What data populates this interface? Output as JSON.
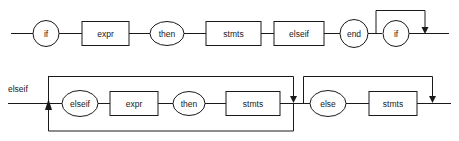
{
  "diagram": {
    "kind": "railroad-syntax-diagram",
    "background_color": "#ffffff",
    "stroke_color": "#1a1a1a",
    "fill_color": "#ffffff",
    "rows": [
      {
        "id": "row-top",
        "entry_label": "",
        "nodes": [
          {
            "id": "top-if",
            "text": "if",
            "shape": "circle"
          },
          {
            "id": "top-expr",
            "text": "expr",
            "shape": "rect"
          },
          {
            "id": "top-then",
            "text": "then",
            "shape": "ellipse"
          },
          {
            "id": "top-stmts",
            "text": "stmts",
            "shape": "rect"
          },
          {
            "id": "top-elseif",
            "text": "elseif",
            "shape": "rect"
          },
          {
            "id": "top-end",
            "text": "end",
            "shape": "circle"
          },
          {
            "id": "top-if2",
            "text": "if",
            "shape": "circle"
          }
        ],
        "bypass_loops": [
          {
            "id": "bypass-if2",
            "over": "top-if2",
            "direction": "above",
            "arrow": "down"
          }
        ]
      },
      {
        "id": "row-bottom",
        "entry_label": "elseif",
        "nodes": [
          {
            "id": "bot-elseif",
            "text": "elseif",
            "shape": "ellipse"
          },
          {
            "id": "bot-expr",
            "text": "expr",
            "shape": "rect"
          },
          {
            "id": "bot-then",
            "text": "then",
            "shape": "ellipse"
          },
          {
            "id": "bot-stmts",
            "text": "stmts",
            "shape": "rect"
          },
          {
            "id": "bot-else",
            "text": "else",
            "shape": "ellipse"
          },
          {
            "id": "bot-stmts2",
            "text": "stmts",
            "shape": "rect"
          }
        ],
        "bypass_loops": [
          {
            "id": "bypass-elseif-group",
            "over": "bot-elseif..bot-stmts",
            "direction": "above",
            "arrow": "down"
          },
          {
            "id": "repeat-elseif-group",
            "over": "bot-elseif..bot-stmts",
            "direction": "below",
            "arrow": "up"
          },
          {
            "id": "bypass-else-group",
            "over": "bot-else..bot-stmts2",
            "direction": "above",
            "arrow": "down"
          }
        ]
      }
    ]
  }
}
